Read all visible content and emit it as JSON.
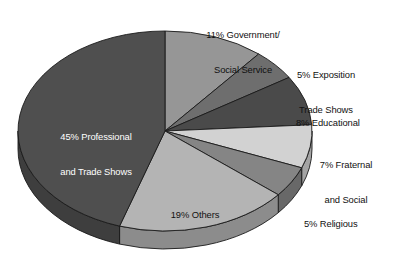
{
  "chart_data": {
    "type": "pie",
    "title": "",
    "subtitle": "",
    "xlabel": "",
    "ylabel": "",
    "legend_position": "none",
    "grid": false,
    "style": "3d-exploded-pie",
    "total": 100,
    "units": "percent",
    "categories": [
      "Government/Social Service",
      "Exposition Trade Shows",
      "Educational",
      "Fraternal and Social",
      "Religious",
      "Others",
      "Professional and Trade Shows"
    ],
    "values": [
      11,
      5,
      8,
      7,
      5,
      19,
      45
    ],
    "labels": [
      "11% Government/\nSocial Service",
      "5% Exposition\nTrade Shows",
      "8% Educational",
      "7% Fraternal\nand Social",
      "5% Religious",
      "19% Others",
      "45% Professional\nand Trade Shows"
    ],
    "colors": [
      "#969696",
      "#6e6e6e",
      "#4a4a4a",
      "#d2d2d2",
      "#858585",
      "#b4b4b4",
      "#4f4f4f"
    ]
  },
  "slices": [
    {
      "key": "government",
      "name": "Government/Social Service",
      "percent": "11%",
      "line1": "11% Government/",
      "line2": "Social Service",
      "value": 11,
      "color": "#969696",
      "label_placement": "outside-top"
    },
    {
      "key": "exposition",
      "name": "Exposition Trade Shows",
      "percent": "5%",
      "line1": "5% Exposition",
      "line2": "Trade Shows",
      "value": 5,
      "color": "#6e6e6e",
      "label_placement": "outside-right"
    },
    {
      "key": "educational",
      "name": "Educational",
      "percent": "8%",
      "line1": "8% Educational",
      "line2": "",
      "value": 8,
      "color": "#4a4a4a",
      "label_placement": "outside-right"
    },
    {
      "key": "fraternal",
      "name": "Fraternal and Social",
      "percent": "7%",
      "line1": "7% Fraternal",
      "line2": "and Social",
      "value": 7,
      "color": "#d2d2d2",
      "label_placement": "outside-right"
    },
    {
      "key": "religious",
      "name": "Religious",
      "percent": "5%",
      "line1": "5% Religious",
      "line2": "",
      "value": 5,
      "color": "#858585",
      "label_placement": "outside-right"
    },
    {
      "key": "others",
      "name": "Others",
      "percent": "19%",
      "line1": "19% Others",
      "line2": "",
      "value": 19,
      "color": "#b4b4b4",
      "label_placement": "inside"
    },
    {
      "key": "professional",
      "name": "Professional and Trade Shows",
      "percent": "45%",
      "line1": "45% Professional",
      "line2": "and Trade Shows",
      "value": 45,
      "color": "#4f4f4f",
      "label_placement": "inside-dark"
    }
  ]
}
